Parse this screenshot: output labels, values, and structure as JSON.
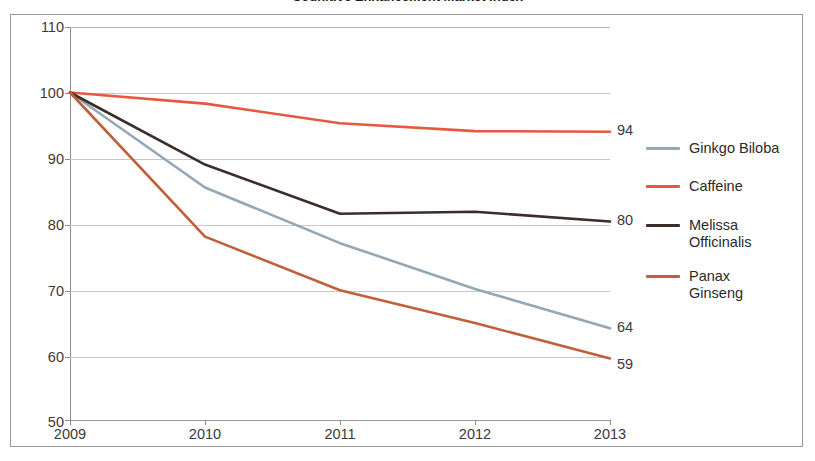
{
  "chart_data": {
    "type": "line",
    "title": "Cognitive Enhancement Market Index",
    "xlabel": "",
    "ylabel": "",
    "categories": [
      "2009",
      "2010",
      "2011",
      "2012",
      "2013"
    ],
    "x": [
      2009,
      2010,
      2011,
      2012,
      2013
    ],
    "ylim": [
      50,
      110
    ],
    "xlim": [
      2009,
      2013
    ],
    "y_ticks": [
      "110",
      "100",
      "90",
      "80",
      "70",
      "60",
      "50"
    ],
    "y_tick_values": [
      110,
      100,
      90,
      80,
      70,
      60,
      50
    ],
    "grid": true,
    "legend_position": "right",
    "series": [
      {
        "name": "Ginkgo Biloba",
        "color": "#94A7B4",
        "values": [
          100,
          85.5,
          77.0,
          70.0,
          64.0
        ],
        "end_label": "64"
      },
      {
        "name": "Caffeine",
        "color": "#E8573F",
        "values": [
          100,
          98.3,
          95.3,
          94.1,
          94.0
        ],
        "end_label": "94"
      },
      {
        "name": "Melissa\nOfficinalis",
        "color": "#3B2E2A",
        "values": [
          100,
          89.0,
          81.5,
          81.8,
          80.3
        ],
        "end_label": "80"
      },
      {
        "name": "Panax\nGinseng",
        "color": "#C0603A",
        "values": [
          100,
          78.0,
          69.8,
          64.8,
          59.4
        ],
        "end_label": "59"
      }
    ]
  },
  "axes": {
    "y_labels": [
      "110",
      "100",
      "90",
      "80",
      "70",
      "60",
      "50"
    ],
    "x_labels": [
      "2009",
      "2010",
      "2011",
      "2012",
      "2013"
    ]
  },
  "legend": {
    "items": [
      {
        "label": "Ginkgo Biloba",
        "color": "#94A7B4"
      },
      {
        "label": "Caffeine",
        "color": "#E8573F"
      },
      {
        "label": "Melissa\nOfficinalis",
        "color": "#3B2E2A"
      },
      {
        "label": "Panax\nGinseng",
        "color": "#C0603A"
      }
    ]
  },
  "end_labels": [
    "94",
    "80",
    "64",
    "59"
  ],
  "colors": {
    "ginkgo": "#94A7B4",
    "caffeine": "#E8573F",
    "melissa": "#3B2E2A",
    "panax": "#C0603A",
    "grid": "#c8c8c8",
    "axis": "#8c8c8c",
    "frame": "#9a9a9a",
    "text": "#3a3a3a"
  }
}
